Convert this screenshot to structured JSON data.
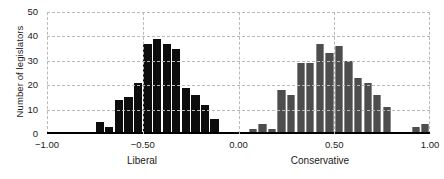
{
  "chart_data": {
    "type": "bar",
    "title": "",
    "subtitle": "",
    "xlabel": "",
    "ylabel": "Number of legislators",
    "xlim": [
      -1.0,
      1.0
    ],
    "ylim": [
      0,
      50
    ],
    "grid": true,
    "legend": "none",
    "xticks": [
      "-1.00",
      "-0.50",
      "0.00",
      "0.50",
      "1.00"
    ],
    "xtick_values": [
      -1.0,
      -0.5,
      0.0,
      0.5,
      1.0
    ],
    "yticks": [
      "0",
      "10",
      "20",
      "30",
      "40",
      "50"
    ],
    "ytick_values": [
      0,
      10,
      20,
      30,
      40,
      50
    ],
    "annotations": [
      "Liberal",
      "Conservative"
    ],
    "bin_width": 0.05,
    "series": [
      {
        "name": "Liberal",
        "color": "#0d0d0d",
        "x": [
          -0.725,
          -0.675,
          -0.625,
          -0.575,
          -0.525,
          -0.475,
          -0.425,
          -0.375,
          -0.325,
          -0.275,
          -0.225,
          -0.175,
          -0.125,
          -0.075
        ],
        "values": [
          5,
          3,
          14,
          15,
          21,
          37,
          39,
          37,
          35,
          19,
          16,
          12,
          6,
          1
        ]
      },
      {
        "name": "Conservative",
        "color": "#4d4d4d",
        "x": [
          -0.025,
          0.025,
          0.075,
          0.125,
          0.175,
          0.225,
          0.275,
          0.325,
          0.375,
          0.425,
          0.475,
          0.525,
          0.575,
          0.625,
          0.675,
          0.725,
          0.775,
          0.825,
          0.925,
          0.975
        ],
        "values": [
          1,
          1,
          2,
          4,
          2,
          18,
          16,
          29,
          29,
          37,
          33,
          36,
          30,
          23,
          21,
          16,
          11,
          0,
          3,
          4
        ]
      }
    ]
  },
  "axis": {
    "y_title": "Number of legislators",
    "x_group_left": "Liberal",
    "x_group_right": "Conservative"
  },
  "colors": {
    "liberal_bar": "#0d0d0d",
    "conservative_bar": "#4d4d4d",
    "gridline": "#b9b9b9",
    "axis": "#000000",
    "background": "#ffffff"
  }
}
